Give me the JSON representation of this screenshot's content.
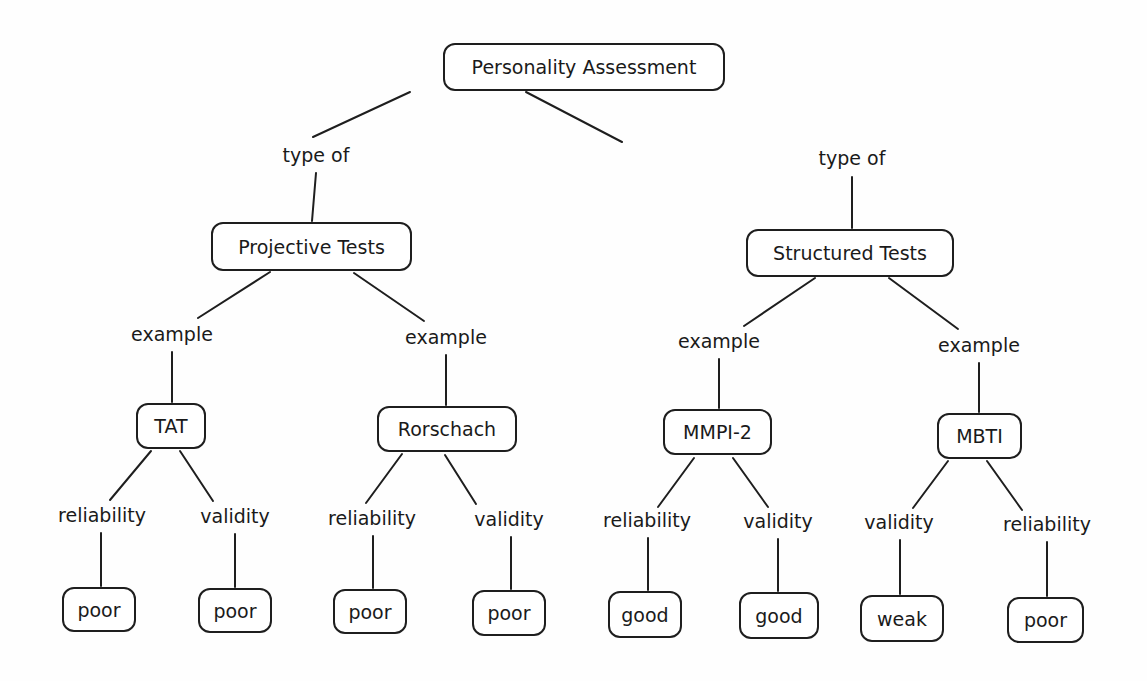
{
  "diagram": {
    "title": "Personality Assessment",
    "stroke_color": "#1e1e1e",
    "nodes": [
      {
        "id": "root",
        "label": "Personality Assessment",
        "x": 443,
        "y": 43,
        "w": 282,
        "h": 48
      },
      {
        "id": "projective",
        "label": "Projective Tests",
        "x": 211,
        "y": 222,
        "w": 201,
        "h": 49
      },
      {
        "id": "structured",
        "label": "Structured Tests",
        "x": 746,
        "y": 229,
        "w": 208,
        "h": 48
      },
      {
        "id": "tat",
        "label": "TAT",
        "x": 136,
        "y": 403,
        "w": 70,
        "h": 46
      },
      {
        "id": "rorschach",
        "label": "Rorschach",
        "x": 377,
        "y": 406,
        "w": 140,
        "h": 46
      },
      {
        "id": "mmpi2",
        "label": "MMPI-2",
        "x": 663,
        "y": 409,
        "w": 109,
        "h": 46
      },
      {
        "id": "mbti",
        "label": "MBTI",
        "x": 937,
        "y": 413,
        "w": 85,
        "h": 46
      },
      {
        "id": "tat_rel",
        "label": "poor",
        "x": 62,
        "y": 587,
        "w": 74,
        "h": 45
      },
      {
        "id": "tat_val",
        "label": "poor",
        "x": 198,
        "y": 588,
        "w": 74,
        "h": 45
      },
      {
        "id": "ror_rel",
        "label": "poor",
        "x": 333,
        "y": 589,
        "w": 74,
        "h": 45
      },
      {
        "id": "ror_val",
        "label": "poor",
        "x": 472,
        "y": 590,
        "w": 74,
        "h": 46
      },
      {
        "id": "mmpi_rel",
        "label": "good",
        "x": 608,
        "y": 591,
        "w": 74,
        "h": 47
      },
      {
        "id": "mmpi_val",
        "label": "good",
        "x": 739,
        "y": 592,
        "w": 80,
        "h": 47
      },
      {
        "id": "mbti_val",
        "label": "weak",
        "x": 860,
        "y": 595,
        "w": 84,
        "h": 47
      },
      {
        "id": "mbti_rel",
        "label": "poor",
        "x": 1007,
        "y": 597,
        "w": 77,
        "h": 46
      }
    ],
    "link_labels": [
      {
        "id": "l_type_left",
        "label": "type of",
        "x": 316,
        "y": 155
      },
      {
        "id": "l_type_right",
        "label": "type of",
        "x": 852,
        "y": 158
      },
      {
        "id": "l_ex_tat",
        "label": "example",
        "x": 172,
        "y": 334
      },
      {
        "id": "l_ex_ror",
        "label": "example",
        "x": 446,
        "y": 337
      },
      {
        "id": "l_ex_mmpi",
        "label": "example",
        "x": 719,
        "y": 341
      },
      {
        "id": "l_ex_mbti",
        "label": "example",
        "x": 979,
        "y": 345
      },
      {
        "id": "l_tat_rel",
        "label": "reliability",
        "x": 102,
        "y": 515
      },
      {
        "id": "l_tat_val",
        "label": "validity",
        "x": 235,
        "y": 516
      },
      {
        "id": "l_ror_rel",
        "label": "reliability",
        "x": 372,
        "y": 518
      },
      {
        "id": "l_ror_val",
        "label": "validity",
        "x": 509,
        "y": 519
      },
      {
        "id": "l_mmpi_rel",
        "label": "reliability",
        "x": 647,
        "y": 520
      },
      {
        "id": "l_mmpi_val",
        "label": "validity",
        "x": 778,
        "y": 521
      },
      {
        "id": "l_mbti_val",
        "label": "validity",
        "x": 899,
        "y": 522
      },
      {
        "id": "l_mbti_rel",
        "label": "reliability",
        "x": 1047,
        "y": 524
      }
    ],
    "edges": [
      {
        "x1": 410,
        "y1": 92,
        "x2": 313,
        "y2": 137
      },
      {
        "x1": 526,
        "y1": 92,
        "x2": 622,
        "y2": 142
      },
      {
        "x1": 316,
        "y1": 173,
        "x2": 312,
        "y2": 221
      },
      {
        "x1": 852,
        "y1": 177,
        "x2": 852,
        "y2": 228
      },
      {
        "x1": 270,
        "y1": 272,
        "x2": 198,
        "y2": 318
      },
      {
        "x1": 354,
        "y1": 273,
        "x2": 424,
        "y2": 321
      },
      {
        "x1": 815,
        "y1": 278,
        "x2": 744,
        "y2": 326
      },
      {
        "x1": 889,
        "y1": 278,
        "x2": 958,
        "y2": 329
      },
      {
        "x1": 172,
        "y1": 352,
        "x2": 172,
        "y2": 402
      },
      {
        "x1": 446,
        "y1": 355,
        "x2": 446,
        "y2": 405
      },
      {
        "x1": 719,
        "y1": 359,
        "x2": 719,
        "y2": 408
      },
      {
        "x1": 979,
        "y1": 363,
        "x2": 979,
        "y2": 412
      },
      {
        "x1": 151,
        "y1": 451,
        "x2": 110,
        "y2": 500
      },
      {
        "x1": 180,
        "y1": 451,
        "x2": 213,
        "y2": 501
      },
      {
        "x1": 402,
        "y1": 454,
        "x2": 366,
        "y2": 503
      },
      {
        "x1": 445,
        "y1": 455,
        "x2": 476,
        "y2": 504
      },
      {
        "x1": 694,
        "y1": 458,
        "x2": 658,
        "y2": 507
      },
      {
        "x1": 733,
        "y1": 458,
        "x2": 768,
        "y2": 507
      },
      {
        "x1": 948,
        "y1": 461,
        "x2": 913,
        "y2": 508
      },
      {
        "x1": 987,
        "y1": 461,
        "x2": 1022,
        "y2": 510
      },
      {
        "x1": 101,
        "y1": 533,
        "x2": 101,
        "y2": 586
      },
      {
        "x1": 235,
        "y1": 534,
        "x2": 235,
        "y2": 587
      },
      {
        "x1": 373,
        "y1": 536,
        "x2": 373,
        "y2": 588
      },
      {
        "x1": 511,
        "y1": 537,
        "x2": 511,
        "y2": 589
      },
      {
        "x1": 648,
        "y1": 538,
        "x2": 648,
        "y2": 590
      },
      {
        "x1": 778,
        "y1": 539,
        "x2": 778,
        "y2": 591
      },
      {
        "x1": 900,
        "y1": 540,
        "x2": 900,
        "y2": 594
      },
      {
        "x1": 1047,
        "y1": 542,
        "x2": 1047,
        "y2": 596
      }
    ]
  }
}
